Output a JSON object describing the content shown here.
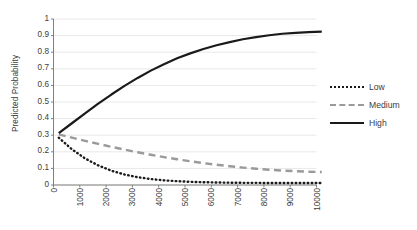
{
  "chart_data": {
    "type": "line",
    "title": "",
    "xlabel": "",
    "ylabel": "Predicted Probability",
    "xlim": [
      0,
      10000
    ],
    "ylim": [
      0,
      1
    ],
    "grid": true,
    "grid_axis": "y",
    "legend_position": "right",
    "xticks": [
      "0",
      "1000",
      "2000",
      "3000",
      "4000",
      "5000",
      "6000",
      "7000",
      "8000",
      "9000",
      "10000"
    ],
    "yticks": [
      "0",
      "0.1",
      "0.2",
      "0.3",
      "0.4",
      "0.5",
      "0.6",
      "0.7",
      "0.8",
      "0.9",
      "1"
    ],
    "x": [
      200,
      700,
      1200,
      1700,
      2200,
      2700,
      3200,
      3700,
      4200,
      4700,
      5200,
      5700,
      6200,
      6700,
      7200,
      7700,
      8200,
      8700,
      9200,
      9700,
      10200
    ],
    "series": [
      {
        "name": "Low",
        "style": "dotted",
        "color": "#1a1a1a",
        "values": [
          0.285,
          0.215,
          0.16,
          0.118,
          0.086,
          0.063,
          0.047,
          0.036,
          0.028,
          0.023,
          0.019,
          0.017,
          0.015,
          0.014,
          0.013,
          0.013,
          0.012,
          0.012,
          0.012,
          0.012,
          0.012
        ]
      },
      {
        "name": "Medium",
        "style": "dashed",
        "color": "#9a9a9a",
        "values": [
          0.305,
          0.285,
          0.266,
          0.248,
          0.23,
          0.213,
          0.197,
          0.182,
          0.168,
          0.155,
          0.143,
          0.132,
          0.122,
          0.113,
          0.105,
          0.098,
          0.092,
          0.087,
          0.083,
          0.08,
          0.078
        ]
      },
      {
        "name": "High",
        "style": "solid",
        "color": "#1a1a1a",
        "values": [
          0.312,
          0.372,
          0.432,
          0.49,
          0.545,
          0.597,
          0.645,
          0.689,
          0.728,
          0.763,
          0.793,
          0.819,
          0.842,
          0.861,
          0.878,
          0.891,
          0.902,
          0.911,
          0.917,
          0.921,
          0.924
        ]
      }
    ]
  },
  "axes": {
    "axis_color": "#808080",
    "grid_color": "#e8e8e8",
    "tick_text_color": "#3c3c3c"
  }
}
